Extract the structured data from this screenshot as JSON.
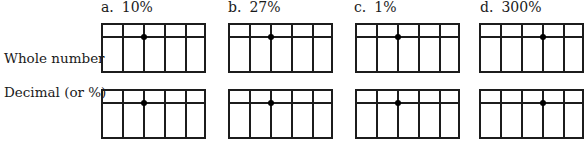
{
  "columns": [
    {
      "letter": "a.",
      "value": "10%",
      "dot_line": 2
    },
    {
      "letter": "b.",
      "value": "27%",
      "dot_line": 2
    },
    {
      "letter": "c.",
      "value": "1%",
      "dot_line": 2
    },
    {
      "letter": "d.",
      "value": "300%",
      "dot_line": 3
    }
  ],
  "rows": [
    {
      "label": "Whole number"
    },
    {
      "label": "Decimal (or %)"
    }
  ],
  "grid": {
    "columns_per_grid": 5,
    "line_color": "#1c1c1c"
  }
}
